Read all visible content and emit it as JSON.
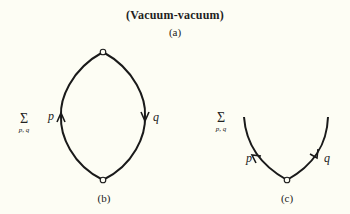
{
  "figure": {
    "title": "(Vacuum-vacuum)",
    "panel_a_label": "(a)",
    "panel_b": {
      "label": "(b)",
      "sum_symbol": "Σ",
      "sum_index": "p, q",
      "line_labels": [
        "p",
        "q"
      ]
    },
    "panel_c": {
      "label": "(c)",
      "sum_symbol": "Σ",
      "sum_index": "p, q",
      "line_labels": [
        "p",
        "q"
      ]
    }
  },
  "colors": {
    "background": "#fdfdf4",
    "line": "#1a1a1a"
  }
}
